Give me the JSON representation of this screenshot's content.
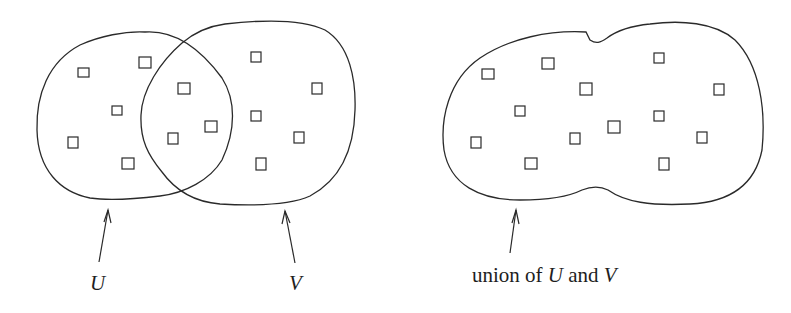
{
  "diagram": {
    "left_figure": {
      "sets": [
        {
          "name": "U",
          "label": "U"
        },
        {
          "name": "V",
          "label": "V"
        }
      ],
      "elements_only_U": 5,
      "elements_intersection": 3,
      "elements_only_V": 5
    },
    "right_figure": {
      "label_prefix": "union of",
      "label_set1": "U",
      "label_and": "and",
      "label_set2": "V",
      "elements_total": 13
    },
    "colors": {
      "stroke": "#2a2a2a",
      "background": "#ffffff",
      "text": "#1e1e1e"
    }
  }
}
